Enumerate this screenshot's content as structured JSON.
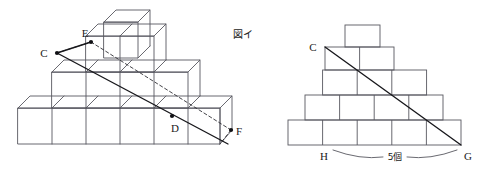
{
  "figure": {
    "caption_right": "図イ",
    "count_label": "5個"
  },
  "left_diagram": {
    "name": "stacked-cubes-3d",
    "points": [
      {
        "id": "C",
        "label": "C",
        "x": 57,
        "y": 53,
        "tx": 44,
        "ty": 57,
        "dot": true
      },
      {
        "id": "E",
        "label": "E",
        "x": 91,
        "y": 42,
        "tx": 85,
        "ty": 37,
        "dot": true
      },
      {
        "id": "D",
        "label": "D",
        "x": 172,
        "y": 116,
        "tx": 173,
        "ty": 131,
        "dot": true
      },
      {
        "id": "F",
        "label": "F",
        "x": 231,
        "y": 130,
        "tx": 236,
        "ty": 136,
        "dot": true
      }
    ],
    "solid_line": {
      "x1": 57,
      "y1": 53,
      "x2": 228,
      "y2": 144
    },
    "dashed_lines": [
      {
        "x1": 91,
        "y1": 42,
        "x2": 231,
        "y2": 130
      }
    ]
  },
  "right_diagram": {
    "name": "stacked-cubes-front-view",
    "points": [
      {
        "id": "C",
        "label": "C",
        "x": 325,
        "y": 47,
        "tx": 313,
        "ty": 51,
        "dot": false
      },
      {
        "id": "H",
        "label": "H",
        "x": 329,
        "y": 145,
        "tx": 322,
        "ty": 158,
        "dot": false
      },
      {
        "id": "G",
        "label": "G",
        "x": 461,
        "y": 145,
        "tx": 465,
        "ty": 158,
        "dot": false
      }
    ],
    "diagonal": {
      "x1": 325,
      "y1": 47,
      "x2": 461,
      "y2": 145
    },
    "brace": {
      "x_start": 333,
      "y": 150,
      "x_end": 457,
      "depth": 9
    },
    "count_text_x": 395,
    "count_text_y": 156
  },
  "colors": {
    "stroke": "#4a4a52",
    "stroke_dark": "#1e1e22",
    "text": "#1a1a1a",
    "background": "#ffffff"
  }
}
